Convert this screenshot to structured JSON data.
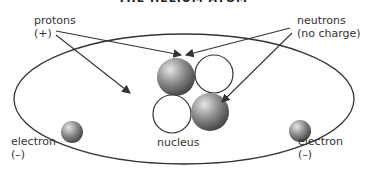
{
  "title": "THE HELIUM ATOM",
  "labels": {
    "protons": "protons",
    "protons_charge": "(+)",
    "neutrons": "neutrons",
    "neutrons_charge": "(no charge)",
    "electron_left": "electron",
    "electron_left_charge": "(–)",
    "electron_right": "electron",
    "electron_right_charge": "(–)",
    "nucleus": "nucleus"
  },
  "colors": {
    "line": "#333333",
    "particle_dark": "#555555",
    "particle_light": "#cccccc"
  }
}
